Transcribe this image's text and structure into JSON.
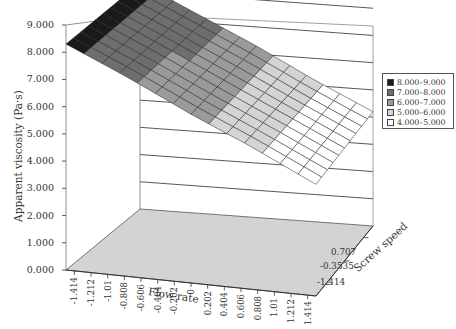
{
  "chart_data": {
    "type": "surface3d",
    "title": "",
    "xlabel": "Flow rate",
    "ylabel": "Apparent viscosity (Pa·s)",
    "zlabel": "Screw speed",
    "x_ticks": [
      "-1.414",
      "-1.212",
      "-1.01",
      "-0.808",
      "-0.606",
      "-0.404",
      "-0.202",
      "0",
      "0.202",
      "0.404",
      "0.606",
      "0.808",
      "1.01",
      "1.212",
      "1.414"
    ],
    "z_ticks": [
      "0.707",
      "-0.3535",
      "-1.414"
    ],
    "y_ticks": [
      "9.000",
      "8.000",
      "7.000",
      "6.000",
      "5.000",
      "4.000",
      "3.000",
      "2.000",
      "1.000",
      "0.000"
    ],
    "ylim": [
      0,
      9
    ],
    "grid": true,
    "legend_position": "right",
    "legend": [
      {
        "label": "8.000–9.000",
        "color": "#1a1a1a"
      },
      {
        "label": "7.000–8.000",
        "color": "#6e6e6e"
      },
      {
        "label": "6.000–7.000",
        "color": "#9a9a9a"
      },
      {
        "label": "5.000–6.000",
        "color": "#d4d4d4"
      },
      {
        "label": "4.000–5.000",
        "color": "#ffffff"
      }
    ],
    "surface_note": "Apparent viscosity decreases roughly linearly with increasing flow rate, from about 8.3 Pa·s at flow rate -1.414 to about 4.1 Pa·s at flow rate 1.414; nearly flat across screw speed.",
    "series": [
      {
        "name": "Screw speed -1.414",
        "x": [
          "-1.414",
          "-0.707",
          "0",
          "0.707",
          "1.414"
        ],
        "values": [
          8.3,
          7.3,
          6.2,
          5.2,
          4.1
        ]
      },
      {
        "name": "Screw speed 0.707",
        "x": [
          "-1.414",
          "-0.707",
          "0",
          "0.707",
          "1.414"
        ],
        "values": [
          8.3,
          7.3,
          6.3,
          5.2,
          4.2
        ]
      }
    ]
  }
}
